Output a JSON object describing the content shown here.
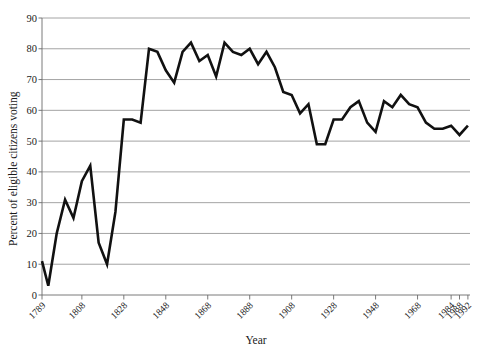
{
  "chart_data": {
    "type": "line",
    "title": "",
    "xlabel": "Year",
    "ylabel": "Percent of eligible citizens voting",
    "xlim": [
      1789,
      1993
    ],
    "ylim": [
      0,
      90
    ],
    "grid": true,
    "legend": false,
    "y_ticks": [
      0,
      10,
      20,
      30,
      40,
      50,
      60,
      70,
      80,
      90
    ],
    "x_tick_labels": [
      "1789",
      "1808",
      "1828",
      "1848",
      "1868",
      "1888",
      "1908",
      "1928",
      "1948",
      "1968",
      "1984",
      "1988",
      "1992"
    ],
    "x_tick_values": [
      1789,
      1808,
      1828,
      1848,
      1868,
      1888,
      1908,
      1928,
      1948,
      1968,
      1984,
      1988,
      1992
    ],
    "series": [
      {
        "name": "Voter turnout",
        "color": "#111111",
        "x": [
          1789,
          1792,
          1796,
          1800,
          1804,
          1808,
          1812,
          1816,
          1820,
          1824,
          1828,
          1832,
          1836,
          1840,
          1844,
          1848,
          1852,
          1856,
          1860,
          1864,
          1868,
          1872,
          1876,
          1880,
          1884,
          1888,
          1892,
          1896,
          1900,
          1904,
          1908,
          1912,
          1916,
          1920,
          1924,
          1928,
          1932,
          1936,
          1940,
          1944,
          1948,
          1952,
          1956,
          1960,
          1964,
          1968,
          1972,
          1976,
          1980,
          1984,
          1988,
          1992
        ],
        "y": [
          11,
          3,
          20,
          31,
          25,
          37,
          42,
          17,
          10,
          27,
          57,
          57,
          56,
          80,
          79,
          73,
          69,
          79,
          82,
          76,
          78,
          71,
          82,
          79,
          78,
          80,
          75,
          79,
          74,
          66,
          65,
          59,
          62,
          49,
          49,
          57,
          57,
          61,
          63,
          56,
          53,
          63,
          61,
          65,
          62,
          61,
          56,
          54,
          54,
          55,
          52,
          55
        ]
      }
    ]
  }
}
